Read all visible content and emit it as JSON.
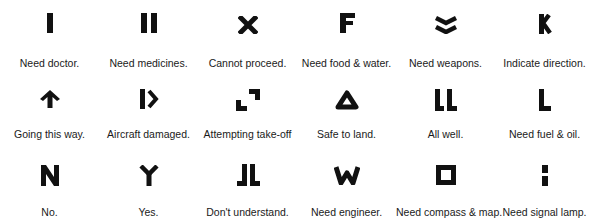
{
  "ink_color": "#111111",
  "signals": [
    {
      "symbol": "single-bar",
      "meaning": "Need doctor."
    },
    {
      "symbol": "double-bar",
      "meaning": "Need medicines."
    },
    {
      "symbol": "x-cross",
      "meaning": "Cannot proceed."
    },
    {
      "symbol": "letter-f",
      "meaning": "Need food & water."
    },
    {
      "symbol": "double-chevron-down",
      "meaning": "Need weapons."
    },
    {
      "symbol": "letter-k",
      "meaning": "Indicate direction."
    },
    {
      "symbol": "arrow-up",
      "meaning": "Going this way."
    },
    {
      "symbol": "bar-and-chevron",
      "meaning": "Aircraft damaged."
    },
    {
      "symbol": "two-corners",
      "meaning": "Attempting take-off"
    },
    {
      "symbol": "triangle",
      "meaning": "Safe to land."
    },
    {
      "symbol": "double-l",
      "meaning": "All well."
    },
    {
      "symbol": "letter-l",
      "meaning": "Need fuel & oil."
    },
    {
      "symbol": "letter-n",
      "meaning": "No."
    },
    {
      "symbol": "letter-y",
      "meaning": "Yes."
    },
    {
      "symbol": "mirrored-double-l",
      "meaning": "Don't understand."
    },
    {
      "symbol": "letter-w",
      "meaning": "Need engineer."
    },
    {
      "symbol": "square",
      "meaning": "Need compass & map."
    },
    {
      "symbol": "split-bar",
      "meaning": "Need signal lamp."
    }
  ]
}
